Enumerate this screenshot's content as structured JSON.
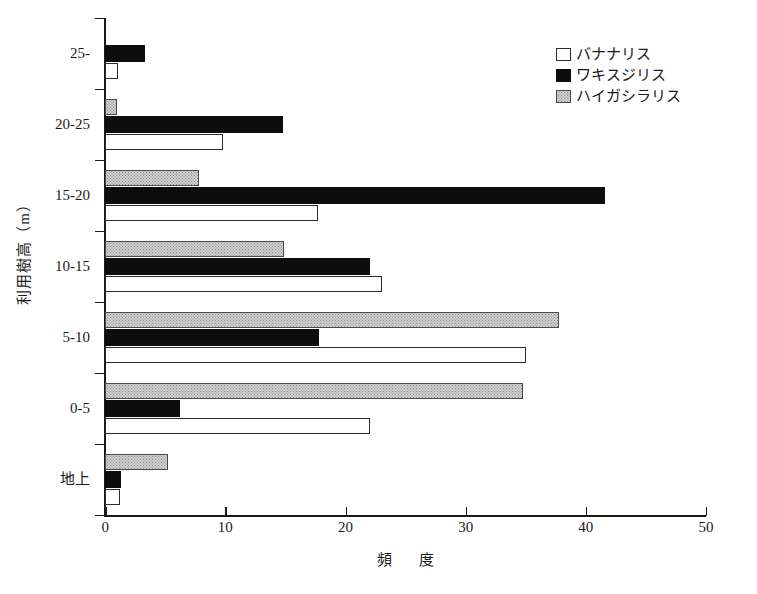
{
  "chart_data": {
    "type": "bar",
    "orientation": "horizontal",
    "title": "",
    "xlabel": "頻　度",
    "ylabel": "利用樹高（m）",
    "xlim": [
      0,
      50
    ],
    "xticks": [
      "0",
      "10",
      "20",
      "30",
      "40",
      "50"
    ],
    "grid": false,
    "legend_position": "top-right",
    "categories": [
      "25-",
      "20-25",
      "15-20",
      "10-15",
      "5-10",
      "0-5",
      "地上"
    ],
    "series": [
      {
        "name": "バナナリス",
        "swatch": "white",
        "color": "#ffffff",
        "values": [
          1.1,
          9.8,
          17.7,
          23.0,
          35.0,
          22.0,
          1.2
        ]
      },
      {
        "name": "ワキスジリス",
        "swatch": "black",
        "color": "#0d0d0d",
        "values": [
          3.3,
          14.8,
          41.6,
          22.0,
          17.8,
          6.2,
          1.3
        ]
      },
      {
        "name": "ハイガシラリス",
        "swatch": "gray",
        "color": "#cfcfcf",
        "values": [
          0.0,
          1.0,
          7.8,
          14.9,
          37.8,
          34.8,
          5.2
        ]
      }
    ]
  },
  "legend": {
    "items": [
      {
        "label": "バナナリス",
        "swatch": "white"
      },
      {
        "label": "ワキスジリス",
        "swatch": "black"
      },
      {
        "label": "ハイガシラリス",
        "swatch": "gray"
      }
    ]
  },
  "axes": {
    "x_title": "頻　度",
    "y_title": "利用樹高（m）",
    "x_tick_labels": [
      "0",
      "10",
      "20",
      "30",
      "40",
      "50"
    ],
    "y_tick_labels": [
      "25-",
      "20-25",
      "15-20",
      "10-15",
      "5-10",
      "0-5",
      "地上"
    ]
  }
}
